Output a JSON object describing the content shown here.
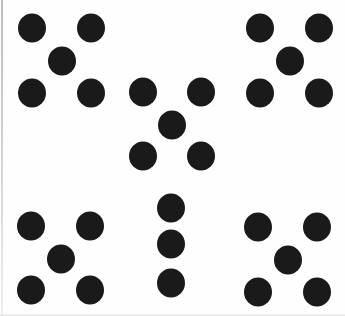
{
  "figure": {
    "dot_color": "#1a1a1a",
    "background_color": "#fefefe",
    "groups": [
      {
        "name": "top-left-x",
        "dots": [
          [
            32,
            28
          ],
          [
            91,
            28
          ],
          [
            62,
            61
          ],
          [
            32,
            93
          ],
          [
            91,
            93
          ]
        ]
      },
      {
        "name": "top-right-x",
        "dots": [
          [
            260,
            28
          ],
          [
            319,
            28
          ],
          [
            290,
            61
          ],
          [
            260,
            93
          ],
          [
            319,
            93
          ]
        ]
      },
      {
        "name": "center-x",
        "dots": [
          [
            143,
            92
          ],
          [
            201,
            92
          ],
          [
            172,
            125
          ],
          [
            143,
            156
          ],
          [
            201,
            156
          ]
        ]
      },
      {
        "name": "bottom-left-x",
        "dots": [
          [
            31,
            226
          ],
          [
            90,
            226
          ],
          [
            61,
            259
          ],
          [
            31,
            290
          ],
          [
            90,
            290
          ]
        ]
      },
      {
        "name": "bottom-center-vertical",
        "dots": [
          [
            171,
            208
          ],
          [
            171,
            244
          ],
          [
            171,
            283
          ]
        ]
      },
      {
        "name": "bottom-right-x",
        "dots": [
          [
            258,
            227
          ],
          [
            317,
            227
          ],
          [
            288,
            260
          ],
          [
            258,
            292
          ],
          [
            317,
            292
          ]
        ]
      }
    ]
  }
}
